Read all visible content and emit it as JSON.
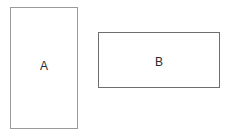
{
  "diagram": {
    "shapes": [
      {
        "id": "A",
        "label": "A",
        "type": "rectangle",
        "orientation": "portrait",
        "border_color": "#9a9a9a"
      },
      {
        "id": "B",
        "label": "B",
        "type": "rectangle",
        "orientation": "landscape",
        "border_color": "#6e6e6e"
      }
    ]
  }
}
